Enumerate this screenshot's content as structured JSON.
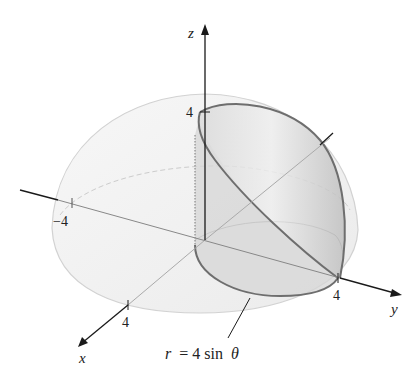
{
  "figure": {
    "colors": {
      "axis": "#1a1a1a",
      "hemisphere_fill": "#f2f2f2",
      "hemisphere_edge": "#cfcfcf",
      "solid_fill": "#c9c9c9",
      "curve": "#6e6e6e"
    },
    "axes": {
      "x_label": "x",
      "y_label": "y",
      "z_label": "z"
    },
    "ticks": {
      "z_pos": "4",
      "x_neg": "−4",
      "x_pos": "4",
      "y_pos": "4"
    },
    "annotation": {
      "r": "r",
      "eq": "= 4 sin",
      "theta": "θ"
    }
  }
}
